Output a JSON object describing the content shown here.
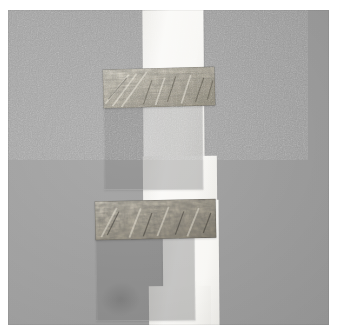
{
  "image": {
    "title": "Mixed-media collage",
    "subject": "Gray card with white vertical paper strip, two horizontal marbled-texture bands and two translucent gray squares",
    "medium": "photograph of paper collage",
    "orientation": "portrait",
    "width_px": 337,
    "height_px": 335,
    "border": {
      "color": "#ffffff",
      "left_px": 8,
      "top_px": 10,
      "right_px": 8,
      "bottom_px": 10
    }
  },
  "palette": {
    "paper_white": "#ffffff",
    "background_gray": "#9e9e9e",
    "strip_white": "#f6f5f1",
    "square_gray": "#767676",
    "band_light": "#cfcabd",
    "band_mid": "#9a9384",
    "band_dark": "#4a4740",
    "shadow": "rgba(0,0,0,0.16)"
  },
  "elements": {
    "background_field": {
      "name": "gray background card",
      "color": "#9e9e9e"
    },
    "white_strip": {
      "name": "white vertical paper strip",
      "color": "#f6f5f1",
      "description": "runs top to bottom, stepped / offset near the middle",
      "segments": [
        {
          "label": "upper segment",
          "x": 135,
          "y": 0,
          "w": 61,
          "h": 150
        },
        {
          "label": "middle step",
          "x": 135,
          "y": 146,
          "w": 74,
          "h": 50
        },
        {
          "label": "lower segment",
          "x": 155,
          "y": 190,
          "w": 56,
          "h": 128
        },
        {
          "label": "lower widening",
          "x": 141,
          "y": 276,
          "w": 62,
          "h": 44
        }
      ]
    },
    "bands": [
      {
        "label": "upper textured band",
        "pattern": "diagonal streaked marbled texture",
        "x": 95,
        "y": 58,
        "w": 112,
        "h": 39,
        "rotation_deg": -1.6
      },
      {
        "label": "lower textured band",
        "pattern": "dense mottled marbled texture",
        "x": 87,
        "y": 190,
        "w": 121,
        "h": 39,
        "rotation_deg": -1.2
      }
    ],
    "squares": [
      {
        "label": "upper translucent gray square",
        "x": 96,
        "y": 93,
        "w": 97,
        "h": 85,
        "rotation_deg": -0.4,
        "opacity": 0.4
      },
      {
        "label": "lower translucent gray square",
        "x": 88,
        "y": 224,
        "w": 97,
        "h": 85,
        "rotation_deg": -0.5,
        "opacity": 0.4
      }
    ]
  }
}
